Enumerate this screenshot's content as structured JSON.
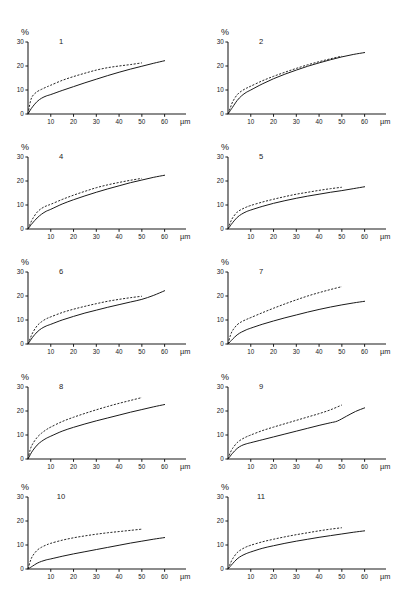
{
  "figure": {
    "panel_count": 11,
    "layout": "2 columns x 5 rows",
    "axis": {
      "y_label": "%",
      "x_unit": "µm",
      "x_ticks": [
        10,
        20,
        30,
        40,
        50,
        60
      ],
      "y_ticks": [
        0,
        10,
        20,
        30
      ],
      "xlim": [
        0,
        65
      ],
      "ylim": [
        0,
        30
      ]
    },
    "legend": {
      "solid": "solid curve",
      "dashed": "dashed curve"
    }
  },
  "chart_data": [
    {
      "type": "line",
      "title": "1",
      "xlabel": "µm",
      "ylabel": "%",
      "xlim": [
        0,
        65
      ],
      "ylim": [
        0,
        30
      ],
      "xticks": [
        10,
        20,
        30,
        40,
        50,
        60
      ],
      "yticks": [
        0,
        10,
        20,
        30
      ],
      "grid": false,
      "series": [
        {
          "name": "dashed",
          "style": "dashed",
          "x": [
            0,
            1,
            2,
            4,
            6,
            8,
            10,
            15,
            20,
            25,
            30,
            35,
            40,
            45,
            50
          ],
          "values": [
            0,
            5.0,
            7.5,
            9.3,
            10.3,
            11.2,
            12.0,
            14.0,
            15.6,
            17.0,
            18.3,
            19.3,
            20.0,
            20.6,
            21.3
          ]
        },
        {
          "name": "solid",
          "style": "solid",
          "x": [
            0,
            1,
            2,
            4,
            6,
            8,
            10,
            15,
            20,
            25,
            30,
            35,
            40,
            45,
            50,
            55,
            60
          ],
          "values": [
            0,
            1.6,
            3.0,
            5.2,
            6.6,
            7.5,
            8.1,
            9.8,
            11.4,
            13.0,
            14.5,
            16.0,
            17.4,
            18.7,
            19.9,
            21.1,
            22.2
          ]
        }
      ]
    },
    {
      "type": "line",
      "title": "2",
      "xlabel": "µm",
      "ylabel": "%",
      "xlim": [
        0,
        65
      ],
      "ylim": [
        0,
        30
      ],
      "xticks": [
        10,
        20,
        30,
        40,
        50,
        60
      ],
      "yticks": [
        0,
        10,
        20,
        30
      ],
      "grid": false,
      "series": [
        {
          "name": "dashed",
          "style": "dashed",
          "x": [
            0,
            1,
            2,
            4,
            6,
            8,
            10,
            15,
            20,
            25,
            30,
            35,
            40,
            45,
            50
          ],
          "values": [
            0,
            2.5,
            5.0,
            8.0,
            9.6,
            10.7,
            11.6,
            13.8,
            15.7,
            17.4,
            19.0,
            20.5,
            21.8,
            23.0,
            24.1
          ]
        },
        {
          "name": "solid",
          "style": "solid",
          "x": [
            0,
            1,
            2,
            4,
            6,
            8,
            10,
            15,
            20,
            25,
            30,
            35,
            40,
            45,
            50,
            55,
            60
          ],
          "values": [
            0,
            1.4,
            2.8,
            5.6,
            7.6,
            9.0,
            10.0,
            12.5,
            14.7,
            16.6,
            18.3,
            19.9,
            21.3,
            22.6,
            23.8,
            24.8,
            25.6
          ]
        }
      ]
    },
    {
      "type": "line",
      "title": "4",
      "xlabel": "µm",
      "ylabel": "%",
      "xlim": [
        0,
        65
      ],
      "ylim": [
        0,
        30
      ],
      "xticks": [
        10,
        20,
        30,
        40,
        50,
        60
      ],
      "yticks": [
        0,
        10,
        20,
        30
      ],
      "grid": false,
      "series": [
        {
          "name": "dashed",
          "style": "dashed",
          "x": [
            0,
            1,
            2,
            4,
            6,
            8,
            10,
            15,
            20,
            25,
            30,
            35,
            40,
            45,
            50
          ],
          "values": [
            0,
            2.2,
            4.2,
            7.0,
            8.6,
            9.6,
            10.3,
            12.3,
            14.1,
            15.7,
            17.2,
            18.4,
            19.4,
            20.3,
            21.1
          ]
        },
        {
          "name": "solid",
          "style": "solid",
          "x": [
            0,
            1,
            2,
            4,
            6,
            8,
            10,
            15,
            20,
            25,
            30,
            35,
            40,
            45,
            50,
            55,
            60
          ],
          "values": [
            0,
            1.3,
            2.5,
            4.6,
            6.2,
            7.4,
            8.2,
            10.4,
            12.2,
            13.8,
            15.3,
            16.7,
            18.0,
            19.3,
            20.4,
            21.5,
            22.4
          ]
        }
      ]
    },
    {
      "type": "line",
      "title": "5",
      "xlabel": "µm",
      "ylabel": "%",
      "xlim": [
        0,
        65
      ],
      "ylim": [
        0,
        30
      ],
      "xticks": [
        10,
        20,
        30,
        40,
        50,
        60
      ],
      "yticks": [
        0,
        10,
        20,
        30
      ],
      "grid": false,
      "series": [
        {
          "name": "dashed",
          "style": "dashed",
          "x": [
            0,
            1,
            2,
            4,
            6,
            8,
            10,
            15,
            20,
            25,
            30,
            35,
            40,
            45,
            50
          ],
          "values": [
            0,
            2.6,
            4.6,
            7.0,
            8.2,
            9.1,
            9.8,
            11.2,
            12.4,
            13.5,
            14.5,
            15.3,
            16.1,
            16.8,
            17.4
          ]
        },
        {
          "name": "solid",
          "style": "solid",
          "x": [
            0,
            1,
            2,
            4,
            6,
            8,
            10,
            15,
            20,
            25,
            30,
            35,
            40,
            45,
            50,
            55,
            60
          ],
          "values": [
            0,
            1.3,
            2.6,
            4.8,
            6.2,
            7.2,
            7.9,
            9.4,
            10.7,
            11.8,
            12.8,
            13.7,
            14.5,
            15.3,
            16.0,
            16.8,
            17.6
          ]
        }
      ]
    },
    {
      "type": "line",
      "title": "6",
      "xlabel": "µm",
      "ylabel": "%",
      "xlim": [
        0,
        65
      ],
      "ylim": [
        0,
        30
      ],
      "xticks": [
        10,
        20,
        30,
        40,
        50,
        60
      ],
      "yticks": [
        0,
        10,
        20,
        30
      ],
      "grid": false,
      "series": [
        {
          "name": "dashed",
          "style": "dashed",
          "x": [
            0,
            1,
            2,
            4,
            6,
            8,
            10,
            15,
            20,
            25,
            30,
            35,
            40,
            45,
            50
          ],
          "values": [
            0,
            2.4,
            4.6,
            7.6,
            9.3,
            10.5,
            11.3,
            13.1,
            14.5,
            15.7,
            16.8,
            17.8,
            18.6,
            19.3,
            19.9
          ]
        },
        {
          "name": "solid",
          "style": "solid",
          "x": [
            0,
            1,
            2,
            4,
            6,
            8,
            10,
            15,
            20,
            25,
            30,
            35,
            40,
            45,
            50,
            55,
            60
          ],
          "values": [
            0,
            1.4,
            2.8,
            5.0,
            6.5,
            7.5,
            8.2,
            10.0,
            11.5,
            12.9,
            14.1,
            15.3,
            16.4,
            17.5,
            18.6,
            20.2,
            22.2
          ]
        }
      ]
    },
    {
      "type": "line",
      "title": "7",
      "xlabel": "µm",
      "ylabel": "%",
      "xlim": [
        0,
        65
      ],
      "ylim": [
        0,
        30
      ],
      "xticks": [
        10,
        20,
        30,
        40,
        50,
        60
      ],
      "yticks": [
        0,
        10,
        20,
        30
      ],
      "grid": false,
      "series": [
        {
          "name": "dashed",
          "style": "dashed",
          "x": [
            0,
            1,
            2,
            4,
            6,
            8,
            10,
            15,
            20,
            25,
            30,
            35,
            40,
            45,
            50
          ],
          "values": [
            0,
            3.4,
            5.6,
            8.0,
            9.3,
            10.2,
            11.0,
            13.0,
            14.9,
            16.7,
            18.4,
            20.0,
            21.4,
            22.7,
            23.9
          ]
        },
        {
          "name": "solid",
          "style": "solid",
          "x": [
            0,
            1,
            2,
            4,
            6,
            8,
            10,
            15,
            20,
            25,
            30,
            35,
            40,
            45,
            50,
            55,
            60
          ],
          "values": [
            0,
            1.0,
            2.0,
            3.8,
            5.0,
            5.9,
            6.6,
            8.2,
            9.6,
            10.9,
            12.1,
            13.3,
            14.4,
            15.4,
            16.3,
            17.1,
            17.8
          ]
        }
      ]
    },
    {
      "type": "line",
      "title": "8",
      "xlabel": "µm",
      "ylabel": "%",
      "xlim": [
        0,
        65
      ],
      "ylim": [
        0,
        30
      ],
      "xticks": [
        10,
        20,
        30,
        40,
        50,
        60
      ],
      "yticks": [
        0,
        10,
        20,
        30
      ],
      "grid": false,
      "series": [
        {
          "name": "dashed",
          "style": "dashed",
          "x": [
            0,
            1,
            2,
            4,
            6,
            8,
            10,
            15,
            20,
            25,
            30,
            35,
            40,
            45,
            50
          ],
          "values": [
            0,
            4.0,
            6.2,
            9.0,
            10.8,
            12.2,
            13.3,
            15.6,
            17.4,
            19.0,
            20.5,
            21.9,
            23.2,
            24.4,
            25.6
          ]
        },
        {
          "name": "solid",
          "style": "solid",
          "x": [
            0,
            1,
            2,
            4,
            6,
            8,
            10,
            15,
            20,
            25,
            30,
            35,
            40,
            45,
            50,
            55,
            60
          ],
          "values": [
            0,
            1.8,
            3.4,
            5.8,
            7.4,
            8.6,
            9.5,
            11.6,
            13.2,
            14.6,
            15.9,
            17.1,
            18.3,
            19.5,
            20.6,
            21.7,
            22.7
          ]
        }
      ]
    },
    {
      "type": "line",
      "title": "9",
      "xlabel": "µm",
      "ylabel": "%",
      "xlim": [
        0,
        65
      ],
      "ylim": [
        0,
        30
      ],
      "xticks": [
        10,
        20,
        30,
        40,
        50,
        60
      ],
      "yticks": [
        0,
        10,
        20,
        30
      ],
      "grid": false,
      "series": [
        {
          "name": "dashed",
          "style": "dashed",
          "x": [
            0,
            1,
            2,
            4,
            6,
            8,
            10,
            15,
            20,
            25,
            30,
            35,
            40,
            45,
            50
          ],
          "values": [
            0,
            2.6,
            4.4,
            6.8,
            8.2,
            9.2,
            10.0,
            11.8,
            13.3,
            14.7,
            16.1,
            17.5,
            18.9,
            20.5,
            22.5
          ]
        },
        {
          "name": "solid",
          "style": "solid",
          "x": [
            0,
            1,
            2,
            4,
            6,
            8,
            10,
            15,
            20,
            25,
            30,
            35,
            40,
            45,
            48,
            52,
            56,
            60
          ],
          "values": [
            0,
            1.2,
            2.4,
            4.4,
            5.6,
            6.3,
            6.8,
            8.0,
            9.2,
            10.4,
            11.6,
            12.8,
            14.0,
            15.1,
            15.8,
            17.8,
            19.8,
            21.3
          ]
        }
      ]
    },
    {
      "type": "line",
      "title": "10",
      "xlabel": "µm",
      "ylabel": "%",
      "xlim": [
        0,
        65
      ],
      "ylim": [
        0,
        30
      ],
      "xticks": [
        10,
        20,
        30,
        40,
        50,
        60
      ],
      "yticks": [
        0,
        10,
        20,
        30
      ],
      "grid": false,
      "series": [
        {
          "name": "dashed",
          "style": "dashed",
          "x": [
            0,
            1,
            2,
            4,
            6,
            8,
            10,
            15,
            20,
            25,
            30,
            35,
            40,
            45,
            50
          ],
          "values": [
            0,
            3.2,
            5.4,
            7.8,
            9.1,
            10.0,
            10.7,
            12.0,
            13.0,
            13.8,
            14.5,
            15.1,
            15.6,
            16.1,
            16.6
          ]
        },
        {
          "name": "solid",
          "style": "solid",
          "x": [
            0,
            1,
            2,
            4,
            6,
            8,
            10,
            15,
            20,
            25,
            30,
            35,
            40,
            45,
            50,
            55,
            60
          ],
          "values": [
            0,
            0.6,
            1.2,
            2.4,
            3.2,
            3.8,
            4.2,
            5.3,
            6.3,
            7.2,
            8.1,
            9.0,
            9.9,
            10.8,
            11.6,
            12.4,
            13.1
          ]
        }
      ]
    },
    {
      "type": "line",
      "title": "11",
      "xlabel": "µm",
      "ylabel": "%",
      "xlim": [
        0,
        65
      ],
      "ylim": [
        0,
        30
      ],
      "xticks": [
        10,
        20,
        30,
        40,
        50,
        60
      ],
      "yticks": [
        0,
        10,
        20,
        30
      ],
      "grid": false,
      "series": [
        {
          "name": "dashed",
          "style": "dashed",
          "x": [
            0,
            1,
            2,
            4,
            6,
            8,
            10,
            15,
            20,
            25,
            30,
            35,
            40,
            45,
            50
          ],
          "values": [
            0,
            2.2,
            4.2,
            6.8,
            8.2,
            9.2,
            9.9,
            11.3,
            12.4,
            13.4,
            14.3,
            15.1,
            15.9,
            16.6,
            17.2
          ]
        },
        {
          "name": "solid",
          "style": "solid",
          "x": [
            0,
            1,
            2,
            4,
            6,
            8,
            10,
            15,
            20,
            25,
            30,
            35,
            40,
            45,
            50,
            55,
            60
          ],
          "values": [
            0,
            1.1,
            2.2,
            4.2,
            5.5,
            6.4,
            7.1,
            8.6,
            9.7,
            10.7,
            11.6,
            12.4,
            13.2,
            13.9,
            14.6,
            15.3,
            15.9
          ]
        }
      ]
    }
  ]
}
